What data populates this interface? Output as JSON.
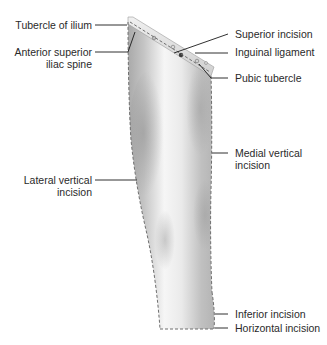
{
  "diagram": {
    "colors": {
      "background": "#ffffff",
      "skin_light": "#f4f4f4",
      "skin_mid": "#d6d6d6",
      "skin_dark": "#a8a8a8",
      "incision_line": "#6f6f6f",
      "leader_line": "#1a1a1a",
      "text": "#2a2a2a"
    },
    "labels_left": [
      {
        "id": "tubercle-of-ilium",
        "line1": "Tubercle of ilium",
        "line2": ""
      },
      {
        "id": "anterior-superior-iliac-spine",
        "line1": "Anterior superior",
        "line2": "iliac spine"
      },
      {
        "id": "lateral-vertical-incision",
        "line1": "Lateral vertical",
        "line2": "incision"
      }
    ],
    "labels_right": [
      {
        "id": "superior-incision",
        "line1": "Superior incision",
        "line2": ""
      },
      {
        "id": "inguinal-ligament",
        "line1": "Inguinal ligament",
        "line2": ""
      },
      {
        "id": "pubic-tubercle",
        "line1": "Pubic tubercle",
        "line2": ""
      },
      {
        "id": "medial-vertical-incision",
        "line1": "Medial vertical",
        "line2": "incision"
      },
      {
        "id": "inferior-incision",
        "line1": "Inferior incision",
        "line2": ""
      },
      {
        "id": "horizontal-incision",
        "line1": "Horizontal incision",
        "line2": ""
      }
    ]
  }
}
